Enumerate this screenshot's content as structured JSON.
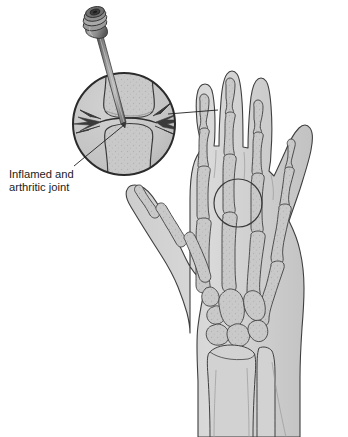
{
  "figure": {
    "annotations": [
      {
        "id": "inflamed-joint",
        "line1": "Inflamed and",
        "line2": "arthritic joint",
        "target": "magnified-joint-inset"
      }
    ],
    "inset": {
      "name": "magnified-joint-inset",
      "shows": "needle-entering-inflamed-metacarpophalangeal-joint",
      "contents": [
        "syringe-needle",
        "proximal-bone",
        "distal-bone",
        "joint-space",
        "pain-radiating-lines"
      ]
    },
    "instrument": {
      "name": "syringe-needle",
      "hub": "luer-lock-hub",
      "shaft": "needle-shaft"
    },
    "highlight": {
      "name": "joint-highlight-circle",
      "location": "middle-finger-metacarpophalangeal-joint"
    },
    "hand": {
      "view": "dorsal",
      "digits": [
        "index-finger",
        "middle-finger",
        "ring-finger",
        "little-finger",
        "thumb"
      ],
      "bone_groups": [
        "distal-phalanges",
        "middle-phalanges",
        "proximal-phalanges",
        "metacarpals",
        "carpals",
        "radius",
        "ulna"
      ]
    },
    "colors": {
      "outline": "#3a3a3a",
      "soft_tissue": "#c9c9c9",
      "bone_fill": "#bdbdbd",
      "bone_light": "#d6d6d6",
      "inset_fill": "#c4c4c4",
      "background": "#ffffff",
      "text": "#1b1b1b",
      "needle_dark": "#4a4a4a",
      "needle_light": "#a8a8a8"
    }
  }
}
